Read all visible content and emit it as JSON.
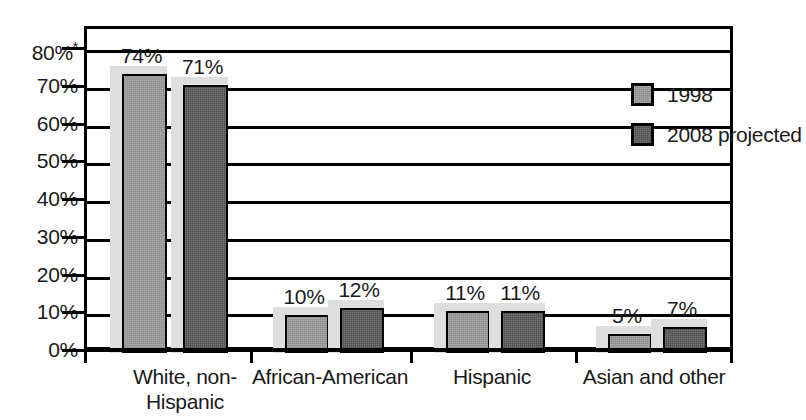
{
  "chart_data": {
    "type": "bar",
    "title": "",
    "subtitle": "",
    "xlabel": "",
    "ylabel": "",
    "ylim": [
      0,
      80
    ],
    "grid": true,
    "legend_position": "top-right",
    "categories": [
      "White, non-\nHispanic",
      "African-American",
      "Hispanic",
      "Asian and other"
    ],
    "series": [
      {
        "name": "1998",
        "color": "#8c8c8c",
        "values": [
          74,
          10,
          11,
          5
        ],
        "value_labels": [
          "74%",
          "10%",
          "11%",
          "5%"
        ]
      },
      {
        "name": "2008 projected",
        "color": "#4d4d4d",
        "values": [
          71,
          12,
          11,
          7
        ],
        "value_labels": [
          "71%",
          "12%",
          "11%",
          "7%"
        ]
      }
    ],
    "y_ticks": [
      {
        "value": 80,
        "label": "80%",
        "asterisk": "*"
      },
      {
        "value": 70,
        "label": "70%",
        "asterisk": ""
      },
      {
        "value": 60,
        "label": "60%",
        "asterisk": ""
      },
      {
        "value": 50,
        "label": "50%",
        "asterisk": ""
      },
      {
        "value": 40,
        "label": "40%",
        "asterisk": ""
      },
      {
        "value": 30,
        "label": "30%",
        "asterisk": ""
      },
      {
        "value": 20,
        "label": "20%",
        "asterisk": ""
      },
      {
        "value": 10,
        "label": "10%",
        "asterisk": ""
      },
      {
        "value": 0,
        "label": "0%",
        "asterisk": ""
      }
    ]
  },
  "legend": {
    "items": [
      {
        "label": "1998"
      },
      {
        "label": "2008 projected"
      }
    ]
  },
  "colors": {
    "series_1998": "#8c8c8c",
    "series_2008": "#4d4d4d",
    "shadow": "#dedede",
    "outline": "#000000",
    "background": "#ffffff"
  }
}
